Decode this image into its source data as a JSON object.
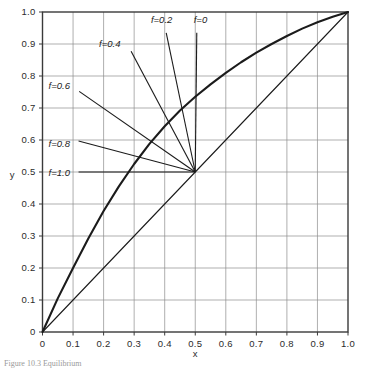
{
  "figure": {
    "caption": "Figure 10.3  Equilibrium",
    "background": "#ffffff",
    "ink_color": "#1b1b1b",
    "grid_color": "#8c8c8c",
    "frame_color": "#3a3a3a"
  },
  "chart_data": {
    "type": "line",
    "title": "",
    "xlabel": "x",
    "ylabel": "y",
    "xlim": [
      0,
      1
    ],
    "ylim": [
      0,
      1
    ],
    "grid": true,
    "legend_position": "inline-annotations",
    "x_ticks": [
      0,
      0.1,
      0.2,
      0.3,
      0.4,
      0.5,
      0.6,
      0.7,
      0.8,
      0.9,
      1.0
    ],
    "x_tick_labels": [
      "0",
      "0.1",
      "0.2",
      "0.3",
      "0.4",
      "0.5",
      "0.6",
      "0.7",
      "0.8",
      "0.9",
      "1.0"
    ],
    "y_ticks": [
      0,
      0.1,
      0.2,
      0.3,
      0.4,
      0.5,
      0.6,
      0.7,
      0.8,
      0.9,
      1.0
    ],
    "y_tick_labels": [
      "0",
      "0.1",
      "0.2",
      "0.3",
      "0.4",
      "0.5",
      "0.6",
      "0.7",
      "0.8",
      "0.9",
      "1.0"
    ],
    "series": [
      {
        "name": "equilibrium-curve",
        "style": "thick",
        "x": [
          0.0,
          0.05,
          0.1,
          0.15,
          0.2,
          0.25,
          0.3,
          0.35,
          0.4,
          0.45,
          0.5,
          0.55,
          0.6,
          0.65,
          0.7,
          0.75,
          0.8,
          0.85,
          0.9,
          0.95,
          1.0
        ],
        "y": [
          0.0,
          0.105,
          0.2,
          0.292,
          0.378,
          0.455,
          0.525,
          0.588,
          0.643,
          0.692,
          0.735,
          0.774,
          0.81,
          0.843,
          0.873,
          0.9,
          0.925,
          0.948,
          0.968,
          0.985,
          1.0
        ]
      },
      {
        "name": "diagonal-45-degree-line",
        "style": "thin",
        "x": [
          0.0,
          1.0
        ],
        "y": [
          0.0,
          1.0
        ]
      }
    ],
    "annotations": [
      {
        "label": "f=0",
        "value": 0.0,
        "label_x": 0.495,
        "label_y": 0.975,
        "anchor_x": 0.5,
        "anchor_y": 0.5,
        "leader_start_x": 0.505,
        "leader_start_y": 0.935
      },
      {
        "label": "f=0.2",
        "value": 0.2,
        "label_x": 0.355,
        "label_y": 0.975,
        "anchor_x": 0.5,
        "anchor_y": 0.5,
        "leader_start_x": 0.405,
        "leader_start_y": 0.935
      },
      {
        "label": "f=0.4",
        "value": 0.4,
        "label_x": 0.185,
        "label_y": 0.9,
        "anchor_x": 0.5,
        "anchor_y": 0.5,
        "leader_start_x": 0.29,
        "leader_start_y": 0.877
      },
      {
        "label": "f=0.6",
        "value": 0.6,
        "label_x": 0.02,
        "label_y": 0.77,
        "anchor_x": 0.5,
        "anchor_y": 0.5,
        "leader_start_x": 0.12,
        "leader_start_y": 0.752
      },
      {
        "label": "f=0.8",
        "value": 0.8,
        "label_x": 0.02,
        "label_y": 0.59,
        "anchor_x": 0.5,
        "anchor_y": 0.5,
        "leader_start_x": 0.118,
        "leader_start_y": 0.597
      },
      {
        "label": "f=1.0",
        "value": 1.0,
        "label_x": 0.02,
        "label_y": 0.498,
        "anchor_x": 0.5,
        "anchor_y": 0.5,
        "leader_start_x": 0.118,
        "leader_start_y": 0.5
      }
    ]
  }
}
